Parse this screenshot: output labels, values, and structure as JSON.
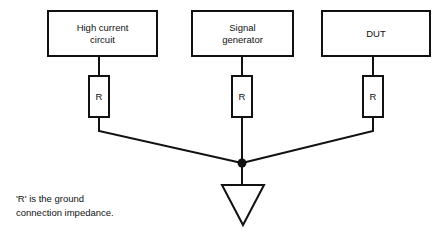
{
  "diagram": {
    "background_color": "#ffffff",
    "line_color": "#111111",
    "blocks": [
      {
        "id": "high-current-circuit",
        "label_line1": "High current",
        "label_line2": "circuit"
      },
      {
        "id": "signal-generator",
        "label_line1": "Signal",
        "label_line2": "generator"
      },
      {
        "id": "dut",
        "label_line1": "DUT",
        "label_line2": ""
      }
    ],
    "resistors": [
      {
        "id": "resistor-left",
        "label": "R"
      },
      {
        "id": "resistor-middle",
        "label": "R"
      },
      {
        "id": "resistor-right",
        "label": "R"
      }
    ],
    "ground": {
      "symbol_name": "ground-triangle",
      "junction_name": "junction-dot"
    },
    "caption": {
      "line1": "'R' is the ground",
      "line2": "connection impedance."
    }
  }
}
